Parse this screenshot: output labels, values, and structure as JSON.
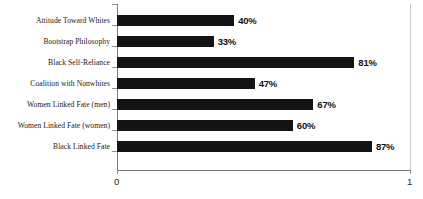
{
  "chart_data": {
    "type": "bar",
    "orientation": "horizontal",
    "title": "",
    "subtitle": "",
    "xlabel": "",
    "ylabel": "",
    "xlim": [
      0,
      1
    ],
    "grid": false,
    "legend": null,
    "bar_color": "#141414",
    "axis_color": "#7a7a7a",
    "categories": [
      "Attitude Toward Whites",
      "Bootstrap Philosophy",
      "Black Self-Reliance",
      "Coalition with Nonwhites",
      "Women Linked Fate (men)",
      "Women Linked Fate (women)",
      "Black Linked Fate"
    ],
    "values": [
      0.4,
      0.33,
      0.81,
      0.47,
      0.67,
      0.6,
      0.87
    ],
    "data_labels": [
      "40%",
      "33%",
      "81%",
      "47%",
      "67%",
      "60%",
      "87%"
    ],
    "xticks": [
      0,
      1
    ],
    "xtick_labels": [
      "0",
      "1"
    ]
  }
}
